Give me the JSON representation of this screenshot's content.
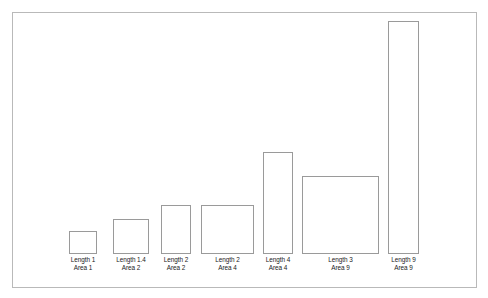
{
  "figure": {
    "background_color": "#ffffff",
    "frame_color": "#b9b9b9",
    "bar_outline_color": "#9a9a9a",
    "bar_fill_color": "#ffffff",
    "label_color": "#1a1a1a"
  },
  "chart_data": {
    "type": "bar",
    "title": "",
    "subtitle": "",
    "xlabel": "",
    "ylabel": "",
    "grid": false,
    "legend": null,
    "axis_visible": false,
    "baseline_y_px": 253,
    "ylim": [
      0,
      233
    ],
    "categories": [
      "Length 1 Area 1",
      "Length 1.4 Area 2",
      "Length 2 Area 2",
      "Length 2 Area 4",
      "Length 4 Area 4",
      "Length 3 Area 9",
      "Length 9 Area 9"
    ],
    "values": [
      23,
      35,
      49,
      49,
      102,
      78,
      233
    ],
    "widths": [
      28,
      36,
      30,
      53,
      30,
      77,
      31
    ],
    "series": [
      {
        "name": "bar height (px)",
        "values": [
          23,
          35,
          49,
          49,
          102,
          78,
          233
        ]
      },
      {
        "name": "bar width (px)",
        "values": [
          28,
          36,
          30,
          53,
          30,
          77,
          31
        ]
      }
    ],
    "annotations": [
      "Length 1",
      "Area 1",
      "Length 1.4",
      "Area 2",
      "Length 2",
      "Area 2",
      "Length 2",
      "Area 4",
      "Length 4",
      "Area 4",
      "Length 3",
      "Area 9",
      "Length 9",
      "Area 9"
    ]
  },
  "bars": [
    {
      "id": "bar-1",
      "length_label": "Length 1",
      "area_label": "Area 1",
      "x": 68,
      "width": 28,
      "height": 23,
      "top": 230
    },
    {
      "id": "bar-2",
      "length_label": "Length 1.4",
      "area_label": "Area 2",
      "x": 112,
      "width": 36,
      "height": 35,
      "top": 218
    },
    {
      "id": "bar-3",
      "length_label": "Length 2",
      "area_label": "Area 2",
      "x": 160,
      "width": 30,
      "height": 49,
      "top": 204
    },
    {
      "id": "bar-4",
      "length_label": "Length 2",
      "area_label": "Area 4",
      "x": 200,
      "width": 53,
      "height": 49,
      "top": 204
    },
    {
      "id": "bar-5",
      "length_label": "Length 4",
      "area_label": "Area 4",
      "x": 262,
      "width": 30,
      "height": 102,
      "top": 151
    },
    {
      "id": "bar-6",
      "length_label": "Length 3",
      "area_label": "Area 9",
      "x": 301,
      "width": 77,
      "height": 78,
      "top": 175
    },
    {
      "id": "bar-7",
      "length_label": "Length 9",
      "area_label": "Area 9",
      "x": 387,
      "width": 31,
      "height": 233,
      "top": 20
    }
  ]
}
